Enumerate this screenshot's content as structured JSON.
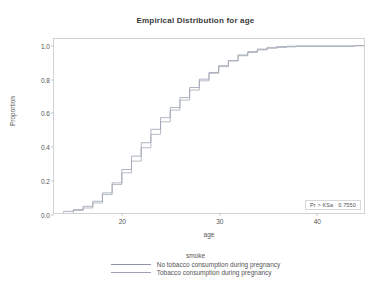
{
  "chart_data": {
    "type": "line",
    "title": "Empirical Distribution for age",
    "xlabel": "age",
    "ylabel": "Proportion",
    "xlim": [
      13,
      45
    ],
    "ylim": [
      0.0,
      1.04
    ],
    "xticks": [
      20,
      30,
      40
    ],
    "yticks": [
      "0.0",
      "0.2",
      "0.4",
      "0.6",
      "0.8",
      "1.0"
    ],
    "ytick_values": [
      0.0,
      0.2,
      0.4,
      0.6,
      0.8,
      1.0
    ],
    "grid": false,
    "legend_position": "bottom",
    "legend_title": "smoke",
    "annotation": {
      "label": "Pr > KSa",
      "value": "0.7550"
    },
    "series": [
      {
        "name": "No tobacco consumption during pregnancy",
        "color": "#8d93a8",
        "step": "post",
        "x": [
          14,
          15,
          16,
          17,
          18,
          19,
          20,
          21,
          22,
          23,
          24,
          25,
          26,
          27,
          28,
          29,
          30,
          31,
          32,
          33,
          34,
          35,
          36,
          37,
          38,
          44
        ],
        "y": [
          0.01,
          0.02,
          0.04,
          0.07,
          0.12,
          0.18,
          0.26,
          0.34,
          0.42,
          0.5,
          0.57,
          0.63,
          0.69,
          0.75,
          0.8,
          0.84,
          0.88,
          0.91,
          0.94,
          0.96,
          0.975,
          0.985,
          0.99,
          0.993,
          0.996,
          1.0
        ]
      },
      {
        "name": "Tobacco consumption during pregnancy",
        "color": "#9aa0ae",
        "step": "post",
        "x": [
          15,
          16,
          17,
          18,
          19,
          20,
          21,
          22,
          23,
          24,
          25,
          26,
          27,
          28,
          29,
          30,
          31,
          32,
          33,
          34,
          35,
          36,
          37,
          38,
          44
        ],
        "y": [
          0.015,
          0.03,
          0.06,
          0.11,
          0.17,
          0.24,
          0.31,
          0.39,
          0.47,
          0.545,
          0.615,
          0.675,
          0.735,
          0.79,
          0.835,
          0.875,
          0.91,
          0.945,
          0.965,
          0.98,
          0.99,
          0.995,
          0.997,
          0.999,
          1.0
        ]
      }
    ]
  }
}
